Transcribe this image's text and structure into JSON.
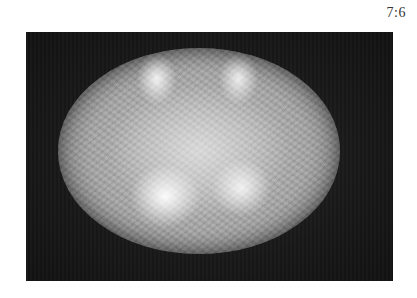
{
  "label": {
    "ratio": "7:6"
  },
  "image": {
    "subject": "elliptical mottled grey disc on dark background"
  }
}
